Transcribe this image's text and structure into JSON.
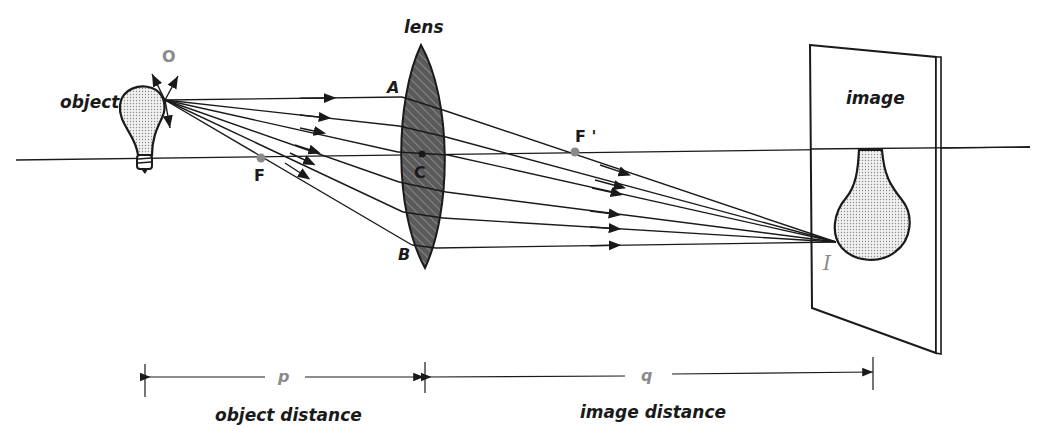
{
  "labels": {
    "object": "object",
    "object_point": "O",
    "lens": "lens",
    "point_a": "A",
    "point_b": "B",
    "point_c": "C",
    "focal_f": "F",
    "focal_f_prime": "F '",
    "image": "image",
    "image_point": "I",
    "p": "p",
    "q": "q",
    "object_distance": "object distance",
    "image_distance": "image distance"
  },
  "colors": {
    "ink": "#1a1a1a",
    "gray_label": "#8a8a8a",
    "lens_fill": "#5a5a5a",
    "bulb_fill": "#d8d8d8",
    "focal_dot": "#8a8a8a"
  },
  "geometry": {
    "object_point": [
      165,
      100
    ],
    "image_point": [
      836,
      242
    ],
    "lens_center": [
      422,
      154
    ],
    "focal_F": [
      261,
      158
    ],
    "focal_F_prime": [
      575,
      152
    ],
    "ray_count": 6
  }
}
